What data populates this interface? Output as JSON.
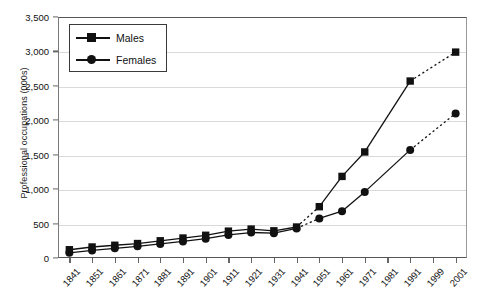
{
  "chart_data": {
    "type": "line",
    "title": "",
    "xlabel": "",
    "ylabel": "Professional occupations (000s)",
    "ylim": [
      0,
      3500
    ],
    "ytick_values": [
      0,
      500,
      1000,
      1500,
      2000,
      2500,
      3000,
      3500
    ],
    "ytick_labels": [
      "0",
      "500",
      "1,000",
      "1,500",
      "2,000",
      "2,500",
      "3,000",
      "3,500"
    ],
    "grid": true,
    "legend_position": "upper left",
    "categories": [
      "1841",
      "1851",
      "1861",
      "1871",
      "1881",
      "1891",
      "1901",
      "1911",
      "1921",
      "1931",
      "1941",
      "1951",
      "1961",
      "1971",
      "1981",
      "1991",
      "1999",
      "2001"
    ],
    "series": [
      {
        "name": "Males",
        "marker": "square",
        "color": "#111111",
        "values": [
          120,
          160,
          185,
          210,
          250,
          290,
          330,
          390,
          420,
          395,
          450,
          745,
          1185,
          1540,
          null,
          2570,
          null,
          2990
        ],
        "dashed_segments": [
          [
            10,
            11
          ],
          [
            15,
            17
          ]
        ]
      },
      {
        "name": "Females",
        "marker": "circle",
        "color": "#111111",
        "values": [
          75,
          110,
          140,
          170,
          205,
          240,
          280,
          335,
          370,
          360,
          430,
          575,
          680,
          960,
          null,
          1570,
          null,
          2100
        ],
        "dashed_segments": [
          [
            10,
            11
          ],
          [
            15,
            17
          ]
        ]
      }
    ]
  },
  "legend": {
    "entries": [
      {
        "label": "Males"
      },
      {
        "label": "Females"
      }
    ]
  }
}
